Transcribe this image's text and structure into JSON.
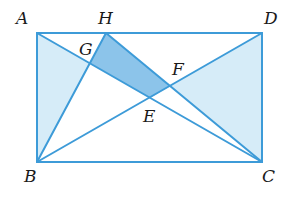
{
  "figure": {
    "colors": {
      "line": "#3d9bd8",
      "light_fill": "#d6ecf8",
      "dark_fill": "#8cc4ea",
      "label": "#1a1a1a"
    },
    "points": {
      "A": {
        "label": "A",
        "x": 37,
        "y": 33,
        "lx": 16,
        "ly": 24
      },
      "H": {
        "label": "H",
        "x": 106,
        "y": 33,
        "lx": 98,
        "ly": 24
      },
      "D": {
        "label": "D",
        "x": 262,
        "y": 33,
        "lx": 264,
        "ly": 24
      },
      "B": {
        "label": "B",
        "x": 37,
        "y": 162,
        "lx": 24,
        "ly": 182
      },
      "C": {
        "label": "C",
        "x": 262,
        "y": 162,
        "lx": 262,
        "ly": 182
      },
      "G": {
        "label": "G",
        "x": 90,
        "y": 63,
        "lx": 79,
        "ly": 55
      },
      "F": {
        "label": "F",
        "x": 170,
        "y": 86,
        "lx": 172,
        "ly": 75
      },
      "E": {
        "label": "E",
        "x": 150,
        "y": 98,
        "lx": 143,
        "ly": 122
      }
    },
    "segments": [
      [
        "A",
        "D"
      ],
      [
        "D",
        "C"
      ],
      [
        "C",
        "B"
      ],
      [
        "B",
        "A"
      ],
      [
        "A",
        "C"
      ],
      [
        "B",
        "D"
      ],
      [
        "B",
        "H"
      ],
      [
        "H",
        "C"
      ]
    ],
    "shaded_regions": [
      {
        "name": "triangle-ABG",
        "points": [
          "A",
          "G",
          "B"
        ],
        "fill": "light"
      },
      {
        "name": "triangle-DFC",
        "points": [
          "D",
          "F",
          "C"
        ],
        "fill": "light"
      },
      {
        "name": "quad-HGEF",
        "points": [
          "H",
          "G",
          "E",
          "F"
        ],
        "fill": "dark"
      }
    ]
  }
}
